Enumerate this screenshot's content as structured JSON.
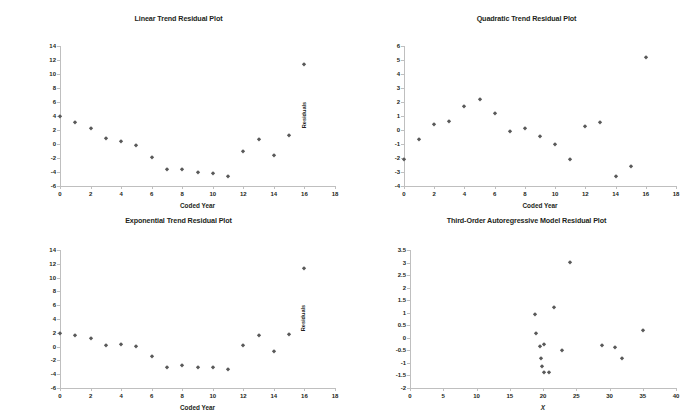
{
  "figure": {
    "background": "#ffffff",
    "marker_color": "#595959",
    "axis_color": "#bfbfbf",
    "text_color": "#231f20",
    "layout": "2x2 grid of residual scatter plots"
  },
  "charts": [
    {
      "id": "linear-trend-residual-plot",
      "type": "scatter",
      "title": "Linear Trend Residual Plot",
      "xlabel": "Coded Year",
      "ylabel": "Residuals",
      "xlim": [
        0,
        18
      ],
      "ylim": [
        -6,
        14
      ],
      "xticks": [
        0,
        2,
        4,
        6,
        8,
        10,
        12,
        14,
        16,
        18
      ],
      "yticks": [
        -6,
        -4,
        -2,
        0,
        2,
        4,
        6,
        8,
        10,
        12,
        14
      ],
      "xticklabels": [
        "0",
        "2",
        "4",
        "6",
        "8",
        "10",
        "12",
        "14",
        "16",
        "18"
      ],
      "yticklabels": [
        "-6",
        "-4",
        "-2",
        "0",
        "2",
        "4",
        "6",
        "8",
        "10",
        "12",
        "14"
      ],
      "grid": false,
      "legend": false,
      "x": [
        0,
        1,
        2,
        3,
        4,
        5,
        6,
        7,
        8,
        9,
        10,
        11,
        12,
        13,
        14,
        15,
        16
      ],
      "y": [
        4.0,
        3.2,
        2.3,
        0.9,
        0.5,
        -0.1,
        -1.9,
        -3.6,
        -3.6,
        -4.0,
        -4.1,
        -4.5,
        -1.0,
        0.7,
        -1.5,
        1.3,
        11.4
      ]
    },
    {
      "id": "quadratic-trend-residual-plot",
      "type": "scatter",
      "title": "Quadratic Trend Residual Plot",
      "xlabel": "Coded Year",
      "ylabel": "Residuals",
      "xlim": [
        0,
        18
      ],
      "ylim": [
        -4,
        6
      ],
      "xticks": [
        0,
        2,
        4,
        6,
        8,
        10,
        12,
        14,
        16,
        18
      ],
      "yticks": [
        -4,
        -3,
        -2,
        -1,
        0,
        1,
        2,
        3,
        4,
        5,
        6
      ],
      "xticklabels": [
        "0",
        "2",
        "4",
        "6",
        "8",
        "10",
        "12",
        "14",
        "16",
        "18"
      ],
      "yticklabels": [
        "-4",
        "-3",
        "-2",
        "-1",
        "0",
        "1",
        "2",
        "3",
        "4",
        "5",
        "6"
      ],
      "grid": false,
      "legend": false,
      "x": [
        0,
        1,
        2,
        3,
        4,
        5,
        6,
        7,
        8,
        9,
        10,
        11,
        12,
        13,
        14,
        15,
        16
      ],
      "y": [
        -2.1,
        -0.65,
        0.45,
        0.65,
        1.7,
        2.2,
        1.2,
        -0.1,
        0.15,
        -0.45,
        -1.0,
        -2.1,
        0.3,
        0.6,
        -3.3,
        -2.55,
        5.2
      ]
    },
    {
      "id": "exponential-trend-residual-plot",
      "type": "scatter",
      "title": "Exponential Trend Residual Plot",
      "xlabel": "Coded Year",
      "ylabel": "Residuals",
      "xlim": [
        0,
        18
      ],
      "ylim": [
        -6,
        14
      ],
      "xticks": [
        0,
        2,
        4,
        6,
        8,
        10,
        12,
        14,
        16,
        18
      ],
      "yticks": [
        -6,
        -4,
        -2,
        0,
        2,
        4,
        6,
        8,
        10,
        12,
        14
      ],
      "xticklabels": [
        "0",
        "2",
        "4",
        "6",
        "8",
        "10",
        "12",
        "14",
        "16",
        "18"
      ],
      "yticklabels": [
        "-6",
        "-4",
        "-2",
        "0",
        "2",
        "4",
        "6",
        "8",
        "10",
        "12",
        "14"
      ],
      "grid": false,
      "legend": false,
      "x": [
        0,
        1,
        2,
        3,
        4,
        5,
        6,
        7,
        8,
        9,
        10,
        11,
        12,
        13,
        14,
        15,
        16
      ],
      "y": [
        2.0,
        1.7,
        1.3,
        0.3,
        0.4,
        0.1,
        -1.3,
        -2.9,
        -2.6,
        -2.9,
        -2.9,
        -3.2,
        0.2,
        1.7,
        -0.7,
        1.8,
        11.4
      ]
    },
    {
      "id": "third-order-autoregressive-model-residual-plot",
      "type": "scatter",
      "title": "Third-Order Autoregressive Model Residual Plot",
      "xlabel": "X",
      "xlabel_italic": true,
      "ylabel": "Residuals",
      "xlim": [
        0,
        40
      ],
      "ylim": [
        -2,
        3.5
      ],
      "xticks": [
        0,
        5,
        10,
        15,
        20,
        25,
        30,
        35,
        40
      ],
      "yticks": [
        -2,
        -1.5,
        -1,
        -0.5,
        0,
        0.5,
        1,
        1.5,
        2,
        2.5,
        3,
        3.5
      ],
      "xticklabels": [
        "0",
        "5",
        "10",
        "15",
        "20",
        "25",
        "30",
        "35",
        "40"
      ],
      "yticklabels": [
        "-2",
        "-1.5",
        "-1",
        "-0.5",
        "0",
        "0.5",
        "1",
        "1.5",
        "2",
        "2.5",
        "3",
        "3.5"
      ],
      "grid": false,
      "legend": false,
      "x": [
        18.8,
        18.9,
        19.6,
        19.7,
        19.9,
        20.1,
        20.2,
        20.9,
        21.7,
        22.9,
        24.0,
        28.8,
        30.9,
        31.9,
        35.0
      ],
      "y": [
        0.93,
        0.2,
        -0.33,
        -0.8,
        -1.13,
        -0.23,
        -1.38,
        -1.38,
        1.22,
        -0.47,
        3.03,
        -0.3,
        -0.36,
        -0.8,
        0.33
      ]
    }
  ]
}
